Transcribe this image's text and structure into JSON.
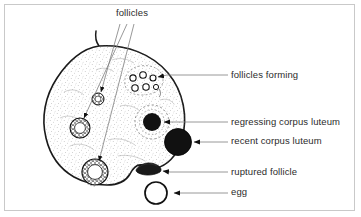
{
  "figure": {
    "background_color": "#ffffff",
    "frame_color": "#c9c9c9",
    "ink_color": "#1a1a1a",
    "label_color": "#2b2b2b",
    "leader_line_color": "#7d7d7d"
  },
  "labels": {
    "follicles": "follicles",
    "follicles_forming": "follicles forming",
    "regressing_corpus_luteum": "regressing corpus luteum",
    "recent_corpus_luteum": "recent corpus luteum",
    "ruptured_follicle": "ruptured follicle",
    "egg": "egg"
  },
  "structures": [
    {
      "name": "ovary-outline",
      "description": "large rounded ovary body with stippled cortex and small stalk at top",
      "fill": "#ffffff",
      "stroke": "#1a1a1a"
    },
    {
      "name": "follicle-small",
      "label_ref": "follicles",
      "cx": 98,
      "cy": 99,
      "r": 6,
      "lumen_fill": "#ffffff"
    },
    {
      "name": "follicle-medium",
      "label_ref": "follicles",
      "cx": 80,
      "cy": 128,
      "r": 10,
      "lumen_fill": "#ffffff"
    },
    {
      "name": "follicle-large",
      "label_ref": "follicles",
      "cx": 95,
      "cy": 172,
      "r": 13,
      "lumen_fill": "#ffffff"
    },
    {
      "name": "follicles-forming-cluster",
      "label_ref": "follicles_forming",
      "cx": 142,
      "cy": 84,
      "count": 6
    },
    {
      "name": "regressing-corpus-luteum",
      "label_ref": "regressing_corpus_luteum",
      "cx": 152,
      "cy": 122,
      "r": 9,
      "fill": "#111111"
    },
    {
      "name": "recent-corpus-luteum",
      "label_ref": "recent_corpus_luteum",
      "cx": 178,
      "cy": 142,
      "r": 13,
      "fill": "#111111"
    },
    {
      "name": "ruptured-follicle",
      "label_ref": "ruptured_follicle",
      "cx": 152,
      "cy": 170,
      "fill": "#111111"
    },
    {
      "name": "egg",
      "label_ref": "egg",
      "cx": 156,
      "cy": 193,
      "r": 11,
      "fill": "#ffffff",
      "stroke": "#111111"
    }
  ]
}
